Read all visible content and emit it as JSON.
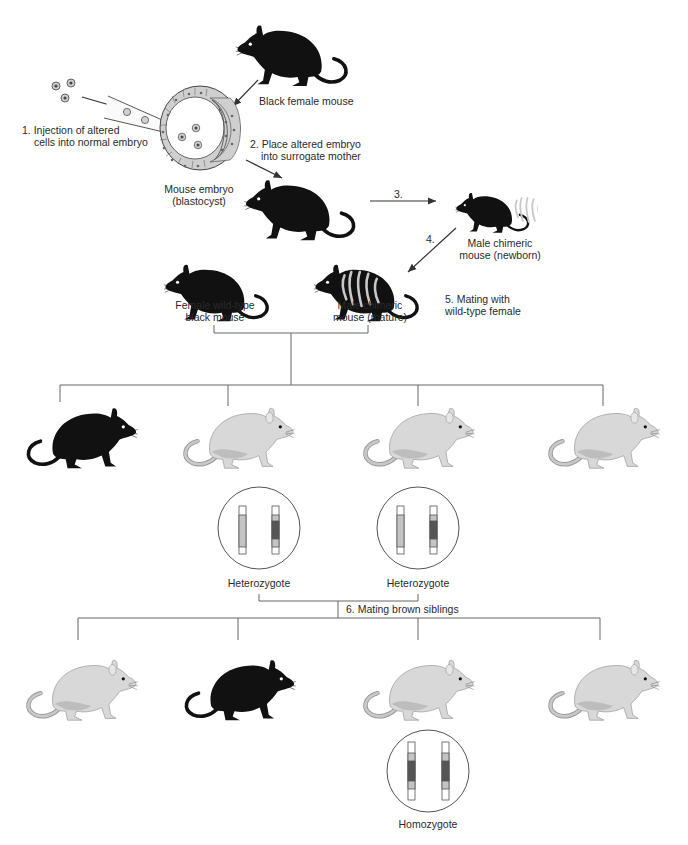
{
  "diagram": {
    "colors": {
      "black_mouse": "#111111",
      "light_mouse_body": "#d6d6d6",
      "light_mouse_shade": "#b8b8b8",
      "line": "#555555",
      "chromosome_light": "#c4c4c4",
      "chromosome_dark": "#555555"
    },
    "labels": {
      "black_female": "Black female mouse",
      "step1_line1": "1. Injection of altered",
      "step1_line2": "cells into normal embryo",
      "embryo_line1": "Mouse embryo",
      "embryo_line2": "(blastocyst)",
      "step2_line1": "2. Place altered embryo",
      "step2_line2": "into surrogate mother",
      "step3": "3.",
      "step4": "4.",
      "newborn_line1": "Male chimeric",
      "newborn_line2": "mouse (newborn)",
      "female_wt_line1": "Female wild-type",
      "female_wt_line2": "black mouse",
      "chimeric_mature_line1": "Male chimeric",
      "chimeric_mature_line2": "mouse (mature)",
      "step5_line1": "5. Mating with",
      "step5_line2": "wild-type female",
      "heterozygote_1": "Heterozygote",
      "heterozygote_2": "Heterozygote",
      "step6": "6. Mating brown siblings",
      "homozygote": "Homozygote"
    },
    "generation_f1": [
      "black",
      "light",
      "light",
      "light"
    ],
    "generation_f2": [
      "light",
      "black",
      "light",
      "light"
    ],
    "genotypes": [
      {
        "label": "Heterozygote",
        "chromosome_a": "wild-type",
        "chromosome_b": "altered"
      },
      {
        "label": "Heterozygote",
        "chromosome_a": "wild-type",
        "chromosome_b": "altered"
      },
      {
        "label": "Homozygote",
        "chromosome_a": "altered",
        "chromosome_b": "altered"
      }
    ]
  }
}
